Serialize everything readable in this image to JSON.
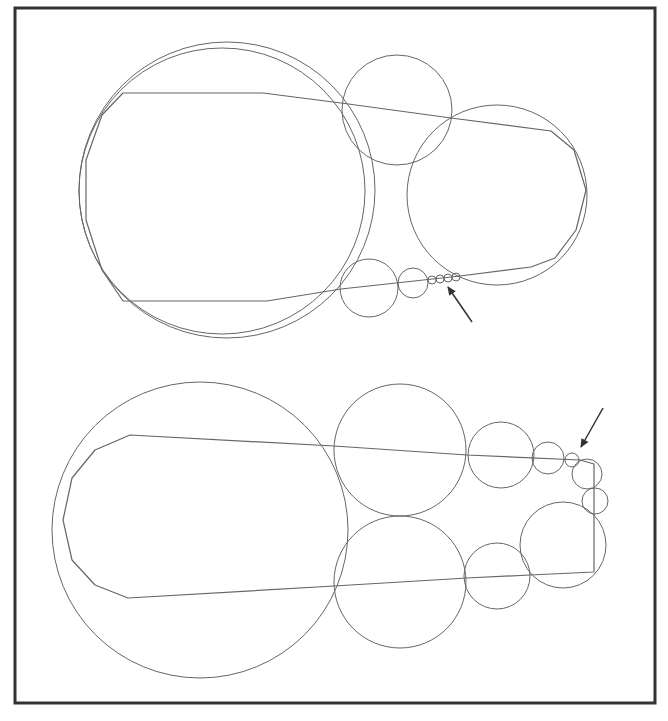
{
  "figure": {
    "background": "#ffffff",
    "frame": {
      "x": 15,
      "y": 8,
      "width": 640,
      "height": 695,
      "stroke": "#333333",
      "stroke_width": 3
    },
    "line_color": "#666666",
    "arrow_color": "#333333",
    "panels": [
      {
        "name": "top-panel",
        "circles": [
          {
            "cx": 227,
            "cy": 190,
            "r": 148
          },
          {
            "cx": 222,
            "cy": 191,
            "r": 143
          },
          {
            "cx": 397,
            "cy": 110,
            "r": 55
          },
          {
            "cx": 497,
            "cy": 195,
            "r": 90
          },
          {
            "cx": 369,
            "cy": 288,
            "r": 29
          },
          {
            "cx": 413,
            "cy": 283,
            "r": 15
          },
          {
            "cx": 432,
            "cy": 280,
            "r": 4
          },
          {
            "cx": 440,
            "cy": 279,
            "r": 4
          },
          {
            "cx": 448,
            "cy": 278,
            "r": 4
          },
          {
            "cx": 456,
            "cy": 277,
            "r": 4
          }
        ],
        "polylines": [
          [
            [
              123,
              93
            ],
            [
              263,
              93
            ],
            [
              341,
              103
            ],
            [
              451,
              118
            ],
            [
              551,
              131
            ],
            [
              574,
              150
            ],
            [
              586,
              190
            ],
            [
              576,
              230
            ],
            [
              555,
              258
            ],
            [
              531,
              267
            ],
            [
              460,
              276
            ],
            [
              341,
              289
            ],
            [
              267,
              301
            ],
            [
              123,
              301
            ],
            [
              102,
              270
            ],
            [
              86,
              220
            ],
            [
              86,
              160
            ],
            [
              102,
              115
            ],
            [
              123,
              93
            ]
          ]
        ],
        "arrow": {
          "from": [
            472,
            322
          ],
          "to": [
            448,
            287
          ]
        }
      },
      {
        "name": "bottom-panel",
        "circles": [
          {
            "cx": 200,
            "cy": 530,
            "r": 148
          },
          {
            "cx": 400,
            "cy": 450,
            "r": 66
          },
          {
            "cx": 400,
            "cy": 582,
            "r": 66
          },
          {
            "cx": 501,
            "cy": 455,
            "r": 33
          },
          {
            "cx": 548,
            "cy": 458,
            "r": 16
          },
          {
            "cx": 572,
            "cy": 460,
            "r": 7
          },
          {
            "cx": 587,
            "cy": 474,
            "r": 15
          },
          {
            "cx": 595,
            "cy": 501,
            "r": 13
          },
          {
            "cx": 563,
            "cy": 545,
            "r": 43
          },
          {
            "cx": 497,
            "cy": 576,
            "r": 33
          }
        ],
        "polylines": [
          [
            [
              130,
              435
            ],
            [
              334,
              446
            ],
            [
              467,
              455
            ],
            [
              580,
              460
            ],
            [
              594,
              464
            ],
            [
              594,
              572
            ],
            [
              530,
              575
            ],
            [
              467,
              578
            ],
            [
              334,
              586
            ],
            [
              128,
              598
            ],
            [
              95,
              585
            ],
            [
              72,
              560
            ],
            [
              63,
              520
            ],
            [
              72,
              478
            ],
            [
              95,
              450
            ],
            [
              130,
              435
            ]
          ]
        ],
        "arrow": {
          "from": [
            603,
            408
          ],
          "to": [
            581,
            447
          ]
        }
      }
    ]
  }
}
